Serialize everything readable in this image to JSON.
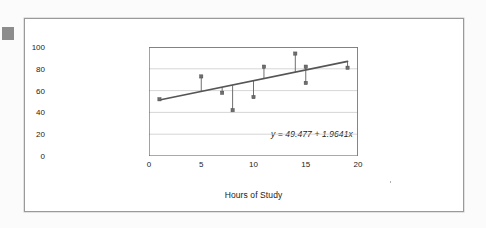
{
  "figure": {
    "caption_equation": "y = 49.477 + 1.9641x",
    "frame_color": "#9a9a9a",
    "background_color": "#ffffff",
    "corner_mark_color": "#8c8c8c"
  },
  "chart_data": {
    "type": "scatter",
    "title": "",
    "xlabel": "Hours of Study",
    "ylabel": "Exam Score",
    "xlim": [
      0,
      20
    ],
    "ylim": [
      0,
      100
    ],
    "xticks": [
      0,
      5,
      10,
      15,
      20
    ],
    "yticks": [
      0,
      20,
      40,
      60,
      80,
      100
    ],
    "grid": "horizontal",
    "legend": "none",
    "annotations": [
      {
        "text": "y = 49.477 + 1.9641x",
        "x": 11.2,
        "y": 33,
        "style": "italic"
      }
    ],
    "series": [
      {
        "name": "Observations",
        "marker": "square",
        "marker_color": "#6f6f6f",
        "points": [
          {
            "x": 1,
            "y": 52
          },
          {
            "x": 5,
            "y": 73
          },
          {
            "x": 7,
            "y": 58
          },
          {
            "x": 8,
            "y": 42
          },
          {
            "x": 10,
            "y": 54
          },
          {
            "x": 11,
            "y": 82
          },
          {
            "x": 14,
            "y": 94
          },
          {
            "x": 15,
            "y": 82
          },
          {
            "x": 15,
            "y": 67
          },
          {
            "x": 19,
            "y": 81
          }
        ]
      },
      {
        "name": "Regression line",
        "type": "line",
        "color": "#555555",
        "equation": "y = 49.477 + 1.9641x",
        "intercept": 49.477,
        "slope": 1.9641,
        "x_start": 1,
        "x_end": 19,
        "y_start": 51.44,
        "y_end": 86.8
      }
    ],
    "residual_stems": true,
    "stem_note": "vertical drop lines connect each observation to the fitted line"
  },
  "axis": {
    "y_tick_labels": [
      "100",
      "80",
      "60",
      "40",
      "20",
      "0"
    ],
    "x_tick_labels": [
      "0",
      "5",
      "10",
      "15",
      "20"
    ]
  }
}
